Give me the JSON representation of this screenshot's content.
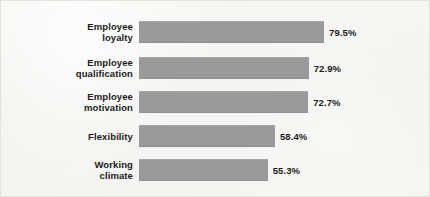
{
  "chart_data": {
    "type": "bar",
    "orientation": "horizontal",
    "title": "",
    "subtitle": "",
    "xlabel": "",
    "ylabel": "",
    "grid": false,
    "legend": null,
    "xlim": [
      0,
      100
    ],
    "value_unit": "%",
    "categories": [
      "Employee\nloyalty",
      "Employee\nqualification",
      "Employee\nmotivation",
      "Flexibility",
      "Working\nclimate"
    ],
    "values": [
      79.5,
      72.9,
      72.7,
      58.4,
      55.3
    ],
    "value_labels": [
      "79.5%",
      "72.9%",
      "72.7%",
      "58.4%",
      "55.3%"
    ],
    "bar_color": "#9a9a9a",
    "background_color": "#f4f4f2",
    "text_color": "#1b1b1b",
    "border_color": "#e2e2de"
  },
  "rows": [
    {
      "label": "Employee\nloyalty",
      "value": 79.5,
      "value_label": "79.5%"
    },
    {
      "label": "Employee\nqualification",
      "value": 72.9,
      "value_label": "72.9%"
    },
    {
      "label": "Employee\nmotivation",
      "value": 72.7,
      "value_label": "72.7%"
    },
    {
      "label": "Flexibility",
      "value": 58.4,
      "value_label": "58.4%"
    },
    {
      "label": "Working\nclimate",
      "value": 55.3,
      "value_label": "55.3%"
    }
  ]
}
